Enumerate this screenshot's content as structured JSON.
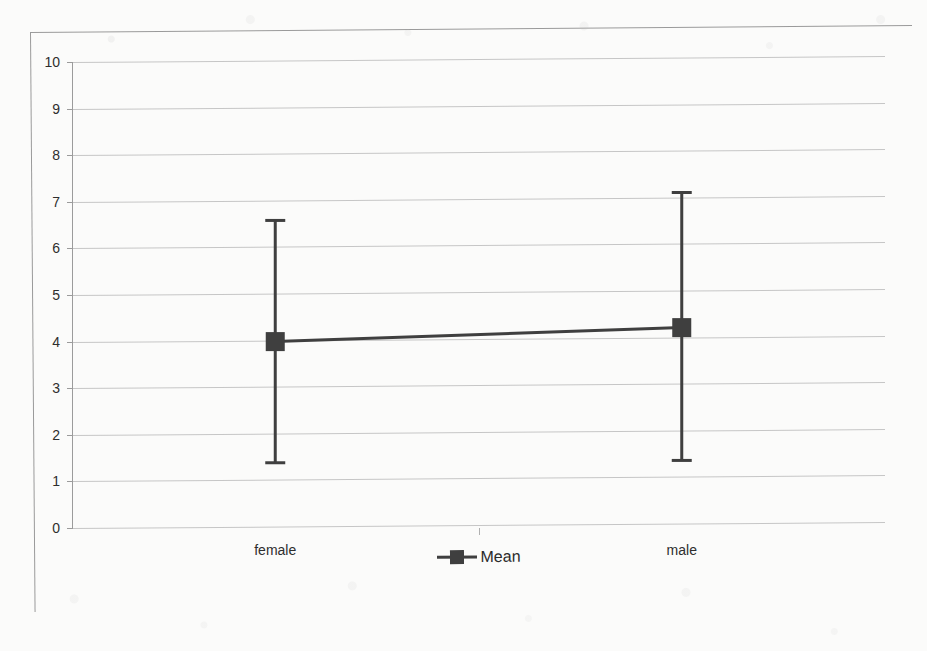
{
  "chart_data": {
    "type": "line",
    "title": "",
    "subtitle": "",
    "xlabel": "",
    "ylabel": "",
    "categories": [
      "female",
      "male"
    ],
    "series": [
      {
        "name": "Mean",
        "values": [
          4.0,
          4.3
        ],
        "error_low": [
          1.4,
          1.45
        ],
        "error_high": [
          6.6,
          7.2
        ]
      }
    ],
    "ylim": [
      0,
      10
    ],
    "ytick_values": [
      0,
      1,
      2,
      3,
      4,
      5,
      6,
      7,
      8,
      9,
      10
    ],
    "ytick_labels": [
      "0",
      "1",
      "2",
      "3",
      "4",
      "5",
      "6",
      "7",
      "8",
      "9",
      "10"
    ],
    "grid": true,
    "legend_position": "bottom",
    "error_bars": "95% CI",
    "marker": "square",
    "colors": {
      "series": "#3f3f3f",
      "gridline": "#c6c6c6",
      "axis": "#9b9b9b",
      "text": "#2e2e2e",
      "background": "#fbfbfa",
      "frame": "#9a9a9a"
    }
  },
  "legend": {
    "entries": [
      {
        "label": "Mean",
        "marker": "square-with-line"
      }
    ]
  },
  "axis": {
    "y_labels": [
      "10",
      "9",
      "8",
      "7",
      "6",
      "5",
      "4",
      "3",
      "2",
      "1",
      "0"
    ]
  },
  "categories": {
    "first": "female",
    "second": "male"
  }
}
